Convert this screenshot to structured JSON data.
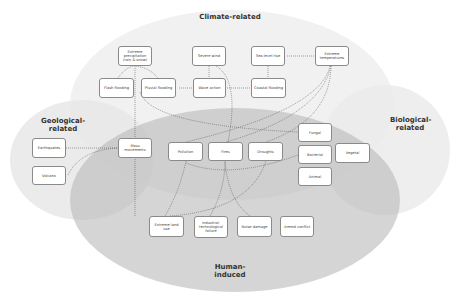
{
  "groups": {
    "climate": {
      "label": "Climate-related",
      "color": "#efefef"
    },
    "geological": {
      "label": "Geological-related",
      "color": "#e9e9e9"
    },
    "biological": {
      "label": "Biological-related",
      "color": "#ececec"
    },
    "human": {
      "label": "Human-induced",
      "color": "#c9c9c9"
    }
  },
  "nodes": {
    "extreme_precip": "Extreme precipitation (rain & snow)",
    "severe_wind": "Severe wind",
    "sea_level": "Sea-level rise",
    "extreme_temp": "Extreme temperatures",
    "flash_flood": "Flash flooding",
    "pluvial_flood": "Pluvial flooding",
    "wave_action": "Wave action",
    "coastal_flood": "Coastal flooding",
    "earthquakes": "Earthquakes",
    "volcano": "Volcano",
    "mass_movements": "Mass movements",
    "pollution": "Pollution",
    "fires": "Fires",
    "droughts": "Droughts",
    "fungal": "Fungal",
    "bacterial": "Bacterial",
    "vegetal": "Vegetal",
    "animal": "Animal",
    "extreme_land_use": "Extreme land use",
    "industrial": "Industrial-technological failure",
    "noise_damage": "Noise damage",
    "armed_conflict": "Armed conflict"
  }
}
